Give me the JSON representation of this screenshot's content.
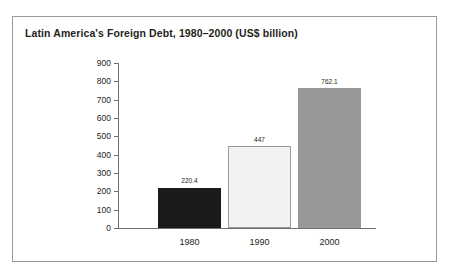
{
  "chart_data": {
    "type": "bar",
    "title": "Latin America's Foreign Debt, 1980–2000 (US$ billion)",
    "xlabel": "",
    "ylabel": "",
    "categories": [
      "1980",
      "1990",
      "2000"
    ],
    "values": [
      220.4,
      447,
      762.1
    ],
    "value_labels": [
      "220.4",
      "447",
      "2000_placeholder"
    ],
    "ylim": [
      0,
      900
    ],
    "yticks": [
      0,
      100,
      200,
      300,
      400,
      500,
      600,
      700,
      800,
      900
    ],
    "ytick_labels": [
      "0",
      "100",
      "200",
      "300",
      "400",
      "500",
      "600",
      "700",
      "800",
      "900"
    ],
    "grid": false,
    "legend": false,
    "bars": [
      {
        "category": "1980",
        "value": 220.4,
        "label": "220.4",
        "color": "#1b1b1b",
        "border": "#1b1b1b"
      },
      {
        "category": "1990",
        "value": 447,
        "label": "447",
        "color": "#f2f2f2",
        "border": "#9a9a9a"
      },
      {
        "category": "2000",
        "value": 762.1,
        "label": "762.1",
        "color": "#989898",
        "border": "#989898"
      }
    ],
    "axis_color": "#6f6f6f",
    "frame_color": "#9a9a9a",
    "background": "#ffffff"
  }
}
